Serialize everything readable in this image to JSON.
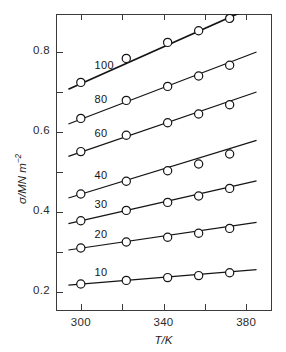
{
  "chart_data": {
    "type": "line",
    "title": "",
    "subtitle": "",
    "xlabel": "T/K",
    "ylabel": "σ/MN m⁻²",
    "xlim": [
      288,
      392
    ],
    "ylim": [
      0.155,
      0.895
    ],
    "grid": false,
    "legend_position": "inline-labels",
    "x_major_ticks": [
      300,
      340,
      380
    ],
    "x_minor_ticks": [
      320,
      360
    ],
    "x_tick_labels": [
      "300",
      "340",
      "380"
    ],
    "y_major_ticks": [
      0.2,
      0.4,
      0.6,
      0.8
    ],
    "y_minor_ticks": [
      0.3,
      0.5,
      0.7
    ],
    "y_tick_labels": [
      "0.2",
      "0.4",
      "0.6",
      "0.8"
    ],
    "x": [
      300,
      322,
      342,
      357,
      372
    ],
    "marker": "open-circle",
    "series": [
      {
        "name": "100",
        "label": "100",
        "values": [
          0.724,
          0.784,
          0.824,
          0.853,
          0.884
        ],
        "line_start": [
          294,
          0.707
        ],
        "line_end": [
          380,
          0.905
        ],
        "label_x": 311,
        "label_y": 0.762
      },
      {
        "name": "80",
        "label": "80",
        "values": [
          0.634,
          0.679,
          0.714,
          0.74,
          0.767
        ],
        "line_start": [
          294,
          0.62
        ],
        "line_end": [
          385,
          0.8
        ],
        "label_x": 311,
        "label_y": 0.678
      },
      {
        "name": "60",
        "label": "60",
        "values": [
          0.551,
          0.592,
          0.623,
          0.645,
          0.668
        ],
        "line_start": [
          294,
          0.539
        ],
        "line_end": [
          385,
          0.7
        ],
        "label_x": 311,
        "label_y": 0.592
      },
      {
        "name": "40",
        "label": "40",
        "values": [
          0.445,
          0.477,
          0.503,
          0.52,
          0.545
        ],
        "line_start": [
          294,
          0.435
        ],
        "line_end": [
          385,
          0.579
        ],
        "label_x": 311,
        "label_y": 0.487
      },
      {
        "name": "30",
        "label": "30",
        "values": [
          0.378,
          0.404,
          0.424,
          0.44,
          0.459
        ],
        "line_start": [
          294,
          0.371
        ],
        "line_end": [
          385,
          0.478
        ],
        "label_x": 311,
        "label_y": 0.414
      },
      {
        "name": "20",
        "label": "20",
        "values": [
          0.31,
          0.325,
          0.337,
          0.347,
          0.359
        ],
        "line_start": [
          294,
          0.305
        ],
        "line_end": [
          385,
          0.374
        ],
        "label_x": 311,
        "label_y": 0.34
      },
      {
        "name": "10",
        "label": "10",
        "values": [
          0.22,
          0.229,
          0.236,
          0.241,
          0.248
        ],
        "line_start": [
          294,
          0.217
        ],
        "line_end": [
          385,
          0.256
        ],
        "label_x": 311,
        "label_y": 0.246
      }
    ]
  }
}
